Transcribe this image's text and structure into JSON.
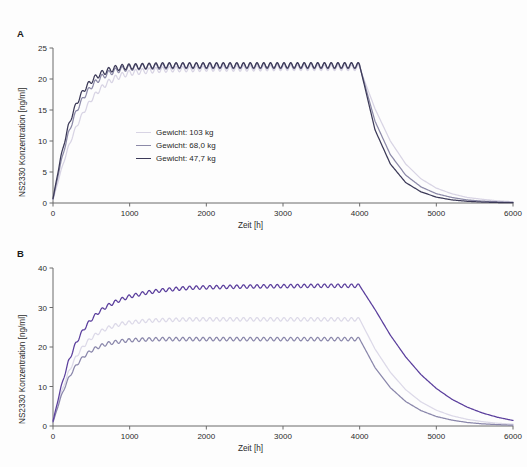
{
  "figure": {
    "background": "#fdfdfd",
    "panels": [
      "A",
      "B"
    ]
  },
  "panel_a": {
    "label": "A",
    "ylabel": "NS2330 Konzentration [ng/ml]",
    "xlabel": "Zeit [h]",
    "legend": [
      {
        "label": "Gewicht: 103 kg",
        "color": "#d8d4e4"
      },
      {
        "label": "Gewicht: 68,0 kg",
        "color": "#8c8aa8"
      },
      {
        "label": "Gewicht: 47,7 kg",
        "color": "#3c3a58"
      }
    ]
  },
  "panel_b": {
    "label": "B",
    "ylabel": "NS2330 Konzentration [ng/ml]",
    "xlabel": "Zeit [h]",
    "legend": [
      {
        "prefix": "Frau, reduzierte Nierenfunktion (",
        "italic": "CL",
        "sub": "CR",
        "suffix": "=35,6 ml/min)",
        "color": "#5b3f9d"
      },
      {
        "prefix": "Frau, normale Nierenfunktion (",
        "italic": "CL",
        "sub": "CR",
        "suffix": ">62,5 ml/min)",
        "color": "#dcd9e8"
      },
      {
        "prefix": "Mann, normale Nierenfunktion (",
        "italic": "CL",
        "sub": "CR",
        "suffix": ">62,5 ml/min)",
        "color": "#8a87ab"
      }
    ]
  },
  "chart_data": [
    {
      "type": "line",
      "panel": "A",
      "title": "",
      "xlabel": "Zeit [h]",
      "ylabel": "NS2330 Konzentration [ng/ml]",
      "xlim": [
        0,
        6000
      ],
      "ylim": [
        0,
        25
      ],
      "xticks": [
        0,
        1000,
        2000,
        3000,
        4000,
        5000,
        6000
      ],
      "yticks": [
        0,
        5,
        10,
        15,
        20,
        25
      ],
      "grid": false,
      "legend_position": "center-left",
      "dose_stop_h": 4000,
      "series": [
        {
          "name": "Gewicht: 103 kg",
          "color": "#d8d4e4",
          "plateau": 21.6,
          "x": [
            0,
            100,
            200,
            300,
            400,
            500,
            600,
            700,
            800,
            900,
            1000,
            1200,
            1400,
            1600,
            1800,
            2000,
            2500,
            3000,
            3500,
            4000,
            4200,
            4400,
            4600,
            4800,
            5000,
            5200,
            5400,
            5600,
            5800,
            6000
          ],
          "y": [
            0.5,
            5.0,
            9.0,
            12.2,
            14.7,
            16.7,
            18.2,
            19.3,
            20.1,
            20.6,
            21.0,
            21.3,
            21.5,
            21.6,
            21.6,
            21.7,
            21.7,
            21.8,
            21.8,
            21.8,
            15.2,
            10.0,
            6.3,
            3.9,
            2.4,
            1.5,
            0.9,
            0.6,
            0.35,
            0.2
          ]
        },
        {
          "name": "Gewicht: 68,0 kg",
          "color": "#8c8aa8",
          "plateau": 22.0,
          "x": [
            0,
            100,
            200,
            300,
            400,
            500,
            600,
            700,
            800,
            900,
            1000,
            1200,
            1400,
            1600,
            1800,
            2000,
            2500,
            3000,
            3500,
            4000,
            4200,
            4400,
            4600,
            4800,
            5000,
            5200,
            5400,
            5600,
            5800,
            6000
          ],
          "y": [
            0.6,
            6.4,
            11.2,
            14.7,
            17.1,
            18.8,
            20.0,
            20.8,
            21.3,
            21.6,
            21.8,
            22.0,
            22.0,
            22.1,
            22.1,
            22.1,
            22.1,
            22.1,
            22.1,
            22.1,
            13.2,
            7.8,
            4.5,
            2.6,
            1.5,
            0.9,
            0.5,
            0.3,
            0.2,
            0.1
          ]
        },
        {
          "name": "Gewicht: 47,7 kg",
          "color": "#3c3a58",
          "plateau": 22.1,
          "x": [
            0,
            100,
            200,
            300,
            400,
            500,
            600,
            700,
            800,
            900,
            1000,
            1200,
            1400,
            1600,
            1800,
            2000,
            2500,
            3000,
            3500,
            4000,
            4200,
            4400,
            4600,
            4800,
            5000,
            5200,
            5400,
            5600,
            5800,
            6000
          ],
          "y": [
            0.7,
            7.3,
            12.4,
            15.9,
            18.2,
            19.7,
            20.7,
            21.3,
            21.7,
            21.9,
            22.0,
            22.1,
            22.2,
            22.2,
            22.2,
            22.2,
            22.2,
            22.2,
            22.2,
            22.2,
            11.8,
            6.3,
            3.3,
            1.8,
            0.95,
            0.5,
            0.28,
            0.15,
            0.08,
            0.05
          ]
        }
      ]
    },
    {
      "type": "line",
      "panel": "B",
      "title": "",
      "xlabel": "Zeit [h]",
      "ylabel": "NS2330 Konzentration [ng/ml]",
      "xlim": [
        0,
        6000
      ],
      "ylim": [
        0,
        40
      ],
      "xticks": [
        0,
        1000,
        2000,
        3000,
        4000,
        5000,
        6000
      ],
      "yticks": [
        0,
        10,
        20,
        30,
        40
      ],
      "grid": false,
      "legend_position": "center-left",
      "dose_stop_h": 4000,
      "series": [
        {
          "name": "Frau, reduzierte Nierenfunktion (CL_CR=35,6 ml/min)",
          "color": "#5b3f9d",
          "plateau": 35.5,
          "x": [
            0,
            100,
            200,
            300,
            400,
            500,
            600,
            700,
            800,
            900,
            1000,
            1200,
            1400,
            1600,
            1800,
            2000,
            2500,
            3000,
            3500,
            4000,
            4200,
            4400,
            4600,
            4800,
            5000,
            5200,
            5400,
            5600,
            5800,
            6000
          ],
          "y": [
            1.2,
            9.5,
            16.2,
            21.0,
            24.5,
            27.0,
            28.9,
            30.3,
            31.3,
            32.1,
            32.8,
            33.7,
            34.3,
            34.7,
            35.0,
            35.1,
            35.3,
            35.4,
            35.5,
            35.5,
            29.5,
            23.0,
            17.5,
            13.0,
            9.5,
            6.8,
            4.8,
            3.3,
            2.2,
            1.4
          ]
        },
        {
          "name": "Frau, normale Nierenfunktion (CL_CR>62,5 ml/min)",
          "color": "#dcd9e8",
          "plateau": 27.0,
          "x": [
            0,
            100,
            200,
            300,
            400,
            500,
            600,
            700,
            800,
            900,
            1000,
            1200,
            1400,
            1600,
            1800,
            2000,
            2500,
            3000,
            3500,
            4000,
            4200,
            4400,
            4600,
            4800,
            5000,
            5200,
            5400,
            5600,
            5800,
            6000
          ],
          "y": [
            1.0,
            8.0,
            13.5,
            17.5,
            20.3,
            22.3,
            23.7,
            24.7,
            25.4,
            25.9,
            26.2,
            26.6,
            26.8,
            26.9,
            27.0,
            27.0,
            27.0,
            27.0,
            27.0,
            27.0,
            19.5,
            13.6,
            9.2,
            6.1,
            4.0,
            2.6,
            1.7,
            1.1,
            0.7,
            0.45
          ]
        },
        {
          "name": "Mann, normale Nierenfunktion (CL_CR>62,5 ml/min)",
          "color": "#8a87ab",
          "plateau": 22.0,
          "x": [
            0,
            100,
            200,
            300,
            400,
            500,
            600,
            700,
            800,
            900,
            1000,
            1200,
            1400,
            1600,
            1800,
            2000,
            2500,
            3000,
            3500,
            4000,
            4200,
            4400,
            4600,
            4800,
            5000,
            5200,
            5400,
            5600,
            5800,
            6000
          ],
          "y": [
            0.9,
            7.2,
            12.0,
            15.3,
            17.6,
            19.1,
            20.1,
            20.8,
            21.2,
            21.5,
            21.7,
            21.9,
            22.0,
            22.0,
            22.0,
            22.0,
            22.0,
            22.0,
            22.0,
            22.0,
            14.8,
            9.7,
            6.2,
            3.9,
            2.4,
            1.5,
            0.9,
            0.55,
            0.35,
            0.2
          ]
        }
      ]
    }
  ]
}
